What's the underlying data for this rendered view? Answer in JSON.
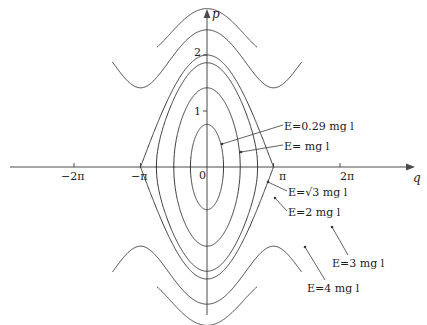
{
  "figure": {
    "title": "",
    "background_color": "#ffffff",
    "curve_color": "#3a3a3a",
    "axis_color": "#4a4a4a",
    "width": 427,
    "height": 325
  },
  "axes": {
    "x_label": "q",
    "y_label": "p",
    "origin_label": "0",
    "x_ticks": [
      {
        "label": "−2π",
        "value": -6.2832
      },
      {
        "label": "−π",
        "value": -3.1416
      },
      {
        "label": "π",
        "value": 3.1416
      },
      {
        "label": "2π",
        "value": 6.2832
      }
    ],
    "y_ticks": [
      {
        "label": "1",
        "value": 1
      },
      {
        "label": "2",
        "value": 2
      }
    ]
  },
  "labels": [
    {
      "id": "e-029",
      "text": "E=0.29 mg l",
      "energy": 0.29
    },
    {
      "id": "e-1",
      "text": "E= mg l",
      "energy": 1
    },
    {
      "id": "e-sqrt3",
      "text": "E=√3 mg l",
      "energy": 1.7321
    },
    {
      "id": "e-2",
      "text": "E=2 mg l",
      "energy": 2
    },
    {
      "id": "e-3",
      "text": "E=3 mg l",
      "energy": 3
    },
    {
      "id": "e-4",
      "text": "E=4 mg l",
      "energy": 4
    }
  ],
  "chart_data": {
    "type": "line",
    "xlabel": "q",
    "ylabel": "p",
    "xlim": [
      -8.2,
      8.2
    ],
    "ylim": [
      -2.6,
      2.6
    ],
    "grid": false,
    "legend": "inline-annotations",
    "series": [
      {
        "name": "E=0.29 mg l",
        "energy": 0.29,
        "kind": "libration",
        "p_max": 0.762,
        "q_max": 1.413
      },
      {
        "name": "E= mg l",
        "energy": 1.0,
        "kind": "libration",
        "p_max": 1.414,
        "q_max": 1.571
      },
      {
        "name": "E=√3 mg l",
        "energy": 1.7321,
        "kind": "libration",
        "p_max": 1.861,
        "q_max": 2.879
      },
      {
        "name": "E=2 mg l",
        "energy": 2.0,
        "kind": "separatrix",
        "p_max": 2.0,
        "q_max": 3.1416
      },
      {
        "name": "E=3 mg l",
        "energy": 3.0,
        "kind": "rotation",
        "p_max": 2.449,
        "p_min": 1.0
      },
      {
        "name": "E=4 mg l",
        "energy": 4.0,
        "kind": "rotation",
        "p_max": 2.828,
        "p_min": 2.0
      }
    ]
  }
}
